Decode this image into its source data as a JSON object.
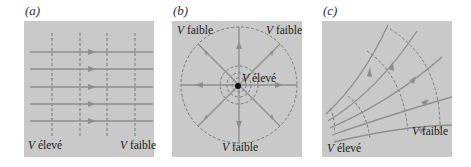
{
  "figure": {
    "panels": [
      {
        "id": "a",
        "label": "(a)",
        "description": "Uniform field: parallel field lines with perpendicular equipotential lines",
        "texts": {
          "high": {
            "symbol": "V",
            "word": "élevé"
          },
          "low": {
            "symbol": "V",
            "word": "faible"
          }
        }
      },
      {
        "id": "b",
        "label": "(b)",
        "description": "Point charge: radial field lines with concentric circular equipotentials",
        "texts": {
          "low_top_left": {
            "symbol": "V",
            "word": "faible"
          },
          "low_top_right": {
            "symbol": "V",
            "word": "faible"
          },
          "high_center": {
            "symbol": "V",
            "word": "élevé"
          },
          "low_bottom": {
            "symbol": "V",
            "word": "faible"
          }
        }
      },
      {
        "id": "c",
        "label": "(c)",
        "description": "Diverging field: fanning field lines with curved equipotential arcs",
        "texts": {
          "low": {
            "symbol": "V",
            "word": "faible"
          },
          "high": {
            "symbol": "V",
            "word": "élevé"
          }
        }
      }
    ],
    "colors": {
      "panel_bg": "#c9c9c9",
      "field_line": "#8e8e8e",
      "equipotential": "#6f6f6f",
      "charge": "#111111"
    }
  }
}
